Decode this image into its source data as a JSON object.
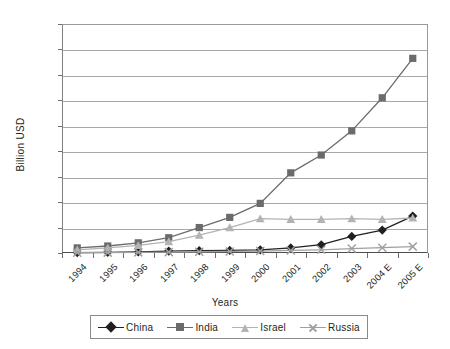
{
  "chart_data": {
    "type": "line",
    "title": "",
    "xlabel": "Years",
    "ylabel": "Billion USD",
    "categories": [
      "1994",
      "1995",
      "1996",
      "1997",
      "1998",
      "1999",
      "2000",
      "2001",
      "2002",
      "2003",
      "2004 E",
      "2005 E"
    ],
    "ylim": [
      0,
      18
    ],
    "yticks": [
      0,
      2,
      4,
      6,
      8,
      10,
      12,
      14,
      16,
      18
    ],
    "grid": true,
    "legend_position": "bottom",
    "series": [
      {
        "name": "China",
        "color": "#231f20",
        "marker": "diamond",
        "values": [
          0.03,
          0.05,
          0.08,
          0.15,
          0.18,
          0.2,
          0.25,
          0.4,
          0.65,
          1.3,
          1.8,
          2.9
        ]
      },
      {
        "name": "India",
        "color": "#6b6b6b",
        "marker": "square",
        "values": [
          0.4,
          0.55,
          0.8,
          1.2,
          2.0,
          2.8,
          3.9,
          6.3,
          7.7,
          9.6,
          12.2,
          15.3
        ]
      },
      {
        "name": "Israel",
        "color": "#b3b3b3",
        "marker": "triangle",
        "values": [
          0.25,
          0.4,
          0.6,
          0.9,
          1.4,
          2.0,
          2.7,
          2.65,
          2.65,
          2.7,
          2.65,
          2.75
        ]
      },
      {
        "name": "Russia",
        "color": "#a0a0a0",
        "marker": "x",
        "values": [
          0.02,
          0.03,
          0.05,
          0.07,
          0.1,
          0.12,
          0.15,
          0.2,
          0.25,
          0.35,
          0.42,
          0.5
        ]
      }
    ]
  },
  "legend": {
    "items": [
      {
        "label": "China"
      },
      {
        "label": "India"
      },
      {
        "label": "Israel"
      },
      {
        "label": "Russia"
      }
    ]
  }
}
